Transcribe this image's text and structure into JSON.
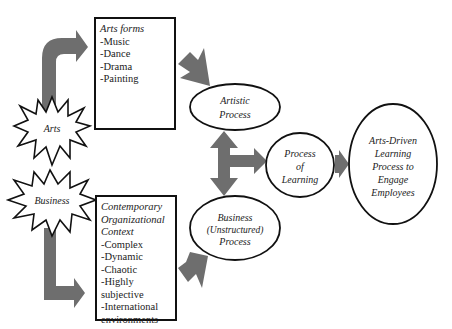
{
  "diagram": {
    "colors": {
      "arrow": "#6e6e6e",
      "outline": "#111111",
      "background": "#ffffff"
    },
    "sources": [
      {
        "id": "arts",
        "label": "Arts",
        "shape": "starburst"
      },
      {
        "id": "business",
        "label": "Business",
        "shape": "starburst"
      }
    ],
    "boxes": {
      "arts_forms": {
        "title": "Arts forms",
        "items": [
          "-Music",
          "-Dance",
          "-Drama",
          "-Painting"
        ]
      },
      "context": {
        "title_lines": [
          "Contemporary",
          "Organizational",
          "Context"
        ],
        "items": [
          "-Complex",
          "-Dynamic",
          "-Chaotic",
          "-Highly subjective",
          "-International",
          "environments"
        ]
      }
    },
    "nodes": {
      "artistic_process": {
        "lines": [
          "Artistic",
          "Process"
        ]
      },
      "business_process": {
        "lines": [
          "Business",
          "(Unstructured)",
          "Process"
        ]
      },
      "process_of_learning": {
        "lines": [
          "Process",
          "of",
          "Learning"
        ]
      },
      "arts_driven": {
        "lines": [
          "Arts-Driven",
          "Learning",
          "Process to",
          "Engage",
          "Employees"
        ]
      }
    },
    "edges": [
      {
        "from": "Arts",
        "to": "Arts forms"
      },
      {
        "from": "Business",
        "to": "Contemporary Organizational Context"
      },
      {
        "from": "Arts forms",
        "to": "Artistic Process"
      },
      {
        "from": "Contemporary Organizational Context",
        "to": "Business (Unstructured) Process"
      },
      {
        "from": "Artistic Process",
        "to": "Business (Unstructured) Process",
        "bidirectional": true
      },
      {
        "from": "Artistic/Business Process",
        "to": "Process of Learning"
      },
      {
        "from": "Process of Learning",
        "to": "Arts-Driven Learning Process to Engage Employees"
      }
    ]
  }
}
